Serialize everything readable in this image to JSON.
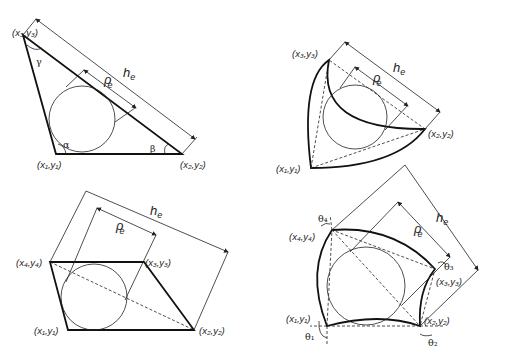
{
  "figure": {
    "panels": [
      {
        "id": "triangle",
        "description": "Straight-sided triangle element with inscribed circle",
        "vertices": [
          "(x1,y1)",
          "(x2,y2)",
          "(x3,y3)"
        ],
        "angles": [
          "α",
          "β",
          "γ"
        ],
        "dimensions": [
          "h_e",
          "ρ_e"
        ]
      },
      {
        "id": "curved-triangle",
        "description": "Curved-sided triangle element with inscribed circle",
        "vertices": [
          "(x1,y1)",
          "(x2,y2)",
          "(x3,y3)"
        ],
        "dimensions": [
          "h_e",
          "ρ_e"
        ]
      },
      {
        "id": "quadrilateral",
        "description": "Straight-sided quadrilateral element with inscribed circle",
        "vertices": [
          "(x1,y1)",
          "(x2,y2)",
          "(x3,y3)",
          "(x4,y4)"
        ],
        "dimensions": [
          "h_e",
          "ρ_e"
        ]
      },
      {
        "id": "curved-quadrilateral",
        "description": "Curved-sided quadrilateral element with inscribed circle",
        "vertices": [
          "(x1,y1)",
          "(x2,y2)",
          "(x3,y3)",
          "(x4,y4)"
        ],
        "angles": [
          "θ1",
          "θ2",
          "θ3",
          "θ4"
        ],
        "dimensions": [
          "h_e",
          "ρ_e"
        ]
      }
    ]
  },
  "labels": {
    "x1y1": "(x₁,y₁)",
    "x2y2": "(x₂,y₂)",
    "x3y3": "(x₃,y₃)",
    "x4y4": "(x₄,y₄)",
    "h": "h",
    "h_sub": "e",
    "rho": "ρ",
    "rho_sub": "e",
    "alpha": "α",
    "beta": "β",
    "gamma": "γ",
    "theta1": "θ₁",
    "theta2": "θ₂",
    "theta3": "θ₃",
    "theta4": "θ₄"
  }
}
